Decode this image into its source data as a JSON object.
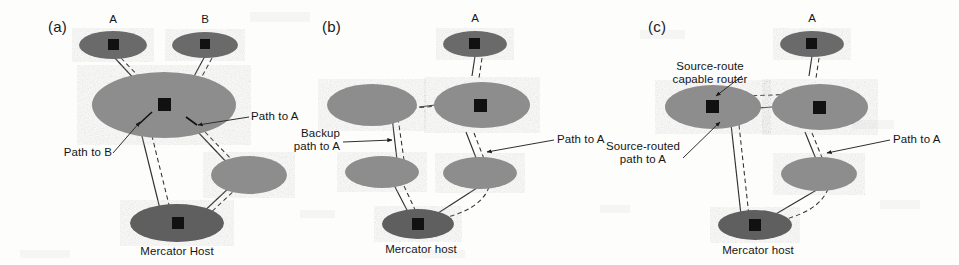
{
  "figure": {
    "background_color": "#fdfdfc",
    "ellipse_fill_light": "#8f8f8f",
    "ellipse_fill_dark": "#6a6a6a",
    "router_color": "#111111",
    "line_color": "#2b2b2b"
  },
  "panels": [
    {
      "tag": "(a)",
      "caption": "Mercator Host",
      "node_labels": [
        "A",
        "B"
      ],
      "annotations": [
        "Path to A",
        "Path to B"
      ],
      "networks": [
        {
          "name": "network-a",
          "shade": "dark",
          "has_router": true
        },
        {
          "name": "network-b",
          "shade": "dark",
          "has_router": true
        },
        {
          "name": "network-center",
          "shade": "light",
          "has_router": true
        },
        {
          "name": "network-right",
          "shade": "light",
          "has_router": false
        },
        {
          "name": "network-mercator-host",
          "shade": "dark",
          "has_router": true
        }
      ]
    },
    {
      "tag": "(b)",
      "caption": "Mercator host",
      "node_labels": [
        "A"
      ],
      "annotations": [
        "Backup\npath to A",
        "Path to A"
      ],
      "networks": [
        {
          "name": "network-a",
          "shade": "dark",
          "has_router": true
        },
        {
          "name": "network-left",
          "shade": "light",
          "has_router": false
        },
        {
          "name": "network-center",
          "shade": "light",
          "has_router": true
        },
        {
          "name": "network-lower-left",
          "shade": "light",
          "has_router": false
        },
        {
          "name": "network-lower-right",
          "shade": "light",
          "has_router": false
        },
        {
          "name": "network-mercator-host",
          "shade": "dark",
          "has_router": true
        }
      ]
    },
    {
      "tag": "(c)",
      "caption": "Mercator host",
      "node_labels": [
        "A"
      ],
      "annotations": [
        "Source-route\ncapable router",
        "Source-routed\npath to A",
        "Path to A"
      ],
      "networks": [
        {
          "name": "network-a",
          "shade": "dark",
          "has_router": true
        },
        {
          "name": "network-source-route-capable",
          "shade": "light",
          "has_router": true
        },
        {
          "name": "network-center",
          "shade": "light",
          "has_router": true
        },
        {
          "name": "network-lower-right",
          "shade": "light",
          "has_router": false
        },
        {
          "name": "network-mercator-host",
          "shade": "dark",
          "has_router": true
        }
      ]
    }
  ],
  "labels": {
    "panel_a_tag": "(a)",
    "panel_b_tag": "(b)",
    "panel_c_tag": "(c)",
    "a_node_a": "A",
    "a_node_b": "B",
    "a_path_to_a": "Path to A",
    "a_path_to_b": "Path to B",
    "a_caption": "Mercator Host",
    "b_node_a": "A",
    "b_backup_path": "Backup\npath to A",
    "b_path_to_a": "Path to A",
    "b_caption": "Mercator host",
    "c_node_a": "A",
    "c_source_route_router": "Source-route\ncapable router",
    "c_source_routed_path": "Source-routed\npath to A",
    "c_path_to_a": "Path to A",
    "c_caption": "Mercator host"
  }
}
